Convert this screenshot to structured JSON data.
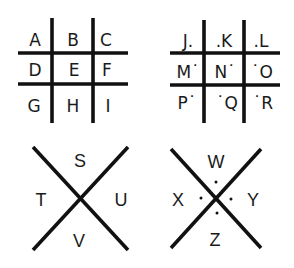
{
  "colors": {
    "ink": "#111111",
    "background": "#ffffff"
  },
  "grid_plain": {
    "rows": [
      [
        "A",
        "B",
        "C"
      ],
      [
        "D",
        "E",
        "F"
      ],
      [
        "G",
        "H",
        "I"
      ]
    ]
  },
  "grid_dotted": {
    "rows": [
      [
        "J.",
        ".K",
        ".L"
      ],
      [
        "M˙",
        "N˙",
        "˙O"
      ],
      [
        "P˙",
        "˙Q",
        "˙R"
      ]
    ]
  },
  "x_plain": {
    "top": "S",
    "left": "T",
    "right": "U",
    "bottom": "V"
  },
  "x_dotted": {
    "top": "W",
    "left": "X",
    "right": "Y",
    "bottom": "Z"
  }
}
